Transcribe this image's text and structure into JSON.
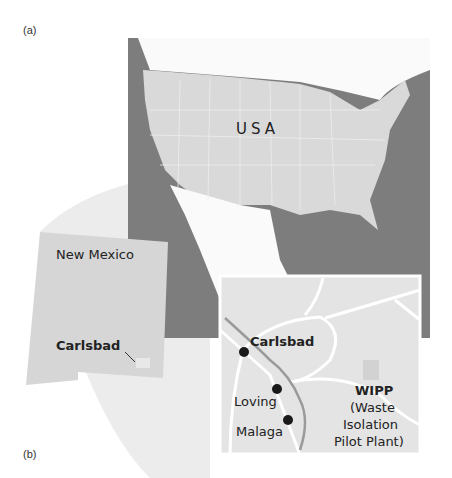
{
  "panels": {
    "a": "(a)",
    "b": "(b)"
  },
  "map": {
    "country_label": "USA",
    "state_label": "New Mexico",
    "state_city_label": "Carlsbad",
    "inset": {
      "cities": [
        {
          "name": "Carlsbad",
          "bold": true
        },
        {
          "name": "Loving",
          "bold": false
        },
        {
          "name": "Malaga",
          "bold": false
        }
      ],
      "site": {
        "name": "WIPP",
        "line1": "(Waste",
        "line2": "Isolation",
        "line3": "Pilot Plant)"
      }
    }
  },
  "colors": {
    "water": "#7d7d7d",
    "land": "#d9d9d9",
    "inset_land": "#e4e4e4",
    "road": "#ffffff",
    "river": "#9a9a9a",
    "city_dot": "#1a1a1a"
  }
}
